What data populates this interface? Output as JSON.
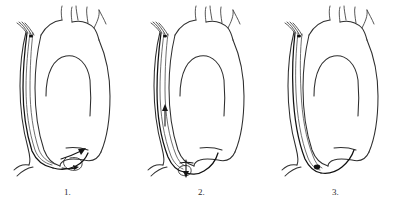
{
  "figure": {
    "background_color": "#ffffff",
    "line_color": "#2e2e2e",
    "wire_color": "#111111",
    "panel_count": 3
  },
  "panels": [
    {
      "id": "panel-1",
      "label": "1.",
      "caption_number": "1",
      "description": "Aortic arch with catheter advanced retrograde up the descending aorta; guidewire forms a loop at the aortic root near the valve, arrow indicates direction of advancement",
      "features": [
        "ascending-aorta",
        "aortic-arch",
        "descending-aorta",
        "brachiocephalic-trunk",
        "left-common-carotid-artery",
        "left-subclavian-artery",
        "aortic-root",
        "catheter-shaft",
        "guidewire",
        "wire-loop",
        "direction-arrow"
      ]
    },
    {
      "id": "panel-2",
      "label": "2.",
      "caption_number": "2",
      "description": "Guidewire loop reduced and redirected at the aortic root; small arrows mark wire advancement and tip rotation",
      "features": [
        "ascending-aorta",
        "aortic-arch",
        "descending-aorta",
        "brachiocephalic-trunk",
        "left-common-carotid-artery",
        "left-subclavian-artery",
        "aortic-root",
        "catheter-shaft",
        "guidewire",
        "wire-loop",
        "advance-arrow",
        "rotation-arrow"
      ]
    },
    {
      "id": "panel-3",
      "label": "3.",
      "caption_number": "3",
      "description": "Catheter and guidewire seated across the aortic root with the loop removed; wire tip marked at the root",
      "features": [
        "ascending-aorta",
        "aortic-arch",
        "descending-aorta",
        "brachiocephalic-trunk",
        "left-common-carotid-artery",
        "left-subclavian-artery",
        "aortic-root",
        "catheter-shaft",
        "guidewire",
        "wire-tip-marker"
      ]
    }
  ]
}
